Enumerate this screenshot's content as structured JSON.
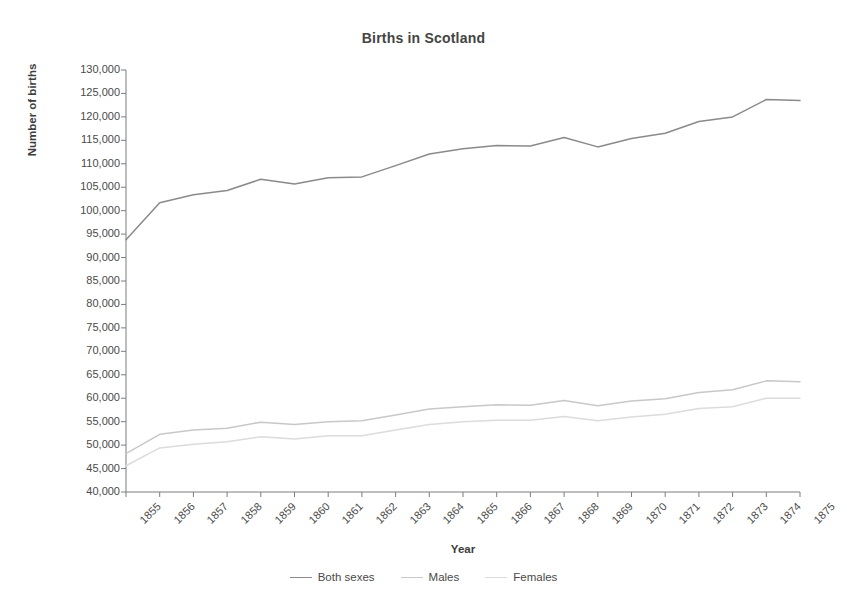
{
  "chart_data": {
    "type": "line",
    "title": "Births in Scotland",
    "xlabel": "Year",
    "ylabel": "Number of births",
    "grid": false,
    "legend_position": "bottom",
    "x": [
      1855,
      1856,
      1857,
      1858,
      1859,
      1860,
      1861,
      1862,
      1863,
      1864,
      1865,
      1866,
      1867,
      1868,
      1869,
      1870,
      1871,
      1872,
      1873,
      1874,
      1875
    ],
    "categories": [
      "1855",
      "1856",
      "1857",
      "1858",
      "1859",
      "1860",
      "1861",
      "1862",
      "1863",
      "1864",
      "1865",
      "1866",
      "1867",
      "1868",
      "1869",
      "1870",
      "1871",
      "1872",
      "1873",
      "1874",
      "1875"
    ],
    "xlim": [
      1855,
      1875
    ],
    "ylim": [
      40000,
      130000
    ],
    "ytick_labels": [
      "130,000",
      "125,000",
      "120,000",
      "115,000",
      "110,000",
      "105,000",
      "100,000",
      "95,000",
      "90,000",
      "85,000",
      "80,000",
      "75,000",
      "70,000",
      "65,000",
      "60,000",
      "55,000",
      "50,000",
      "45,000",
      "40,000"
    ],
    "ytick_values": [
      130000,
      125000,
      120000,
      115000,
      110000,
      105000,
      100000,
      95000,
      90000,
      85000,
      80000,
      75000,
      70000,
      65000,
      60000,
      55000,
      50000,
      45000,
      40000
    ],
    "ytick_step": 5000,
    "series": [
      {
        "name": "Both sexes",
        "color": "#8a8a8a",
        "values": [
          93800,
          101700,
          103400,
          104300,
          106700,
          105700,
          107000,
          107200,
          109600,
          112100,
          113200,
          113900,
          113800,
          115600,
          113600,
          115400,
          116500,
          119000,
          120000,
          123700,
          123500
        ]
      },
      {
        "name": "Males",
        "color": "#c8c8c8",
        "values": [
          48200,
          52300,
          53200,
          53600,
          54900,
          54400,
          55000,
          55200,
          56400,
          57700,
          58200,
          58600,
          58500,
          59500,
          58400,
          59400,
          59900,
          61200,
          61800,
          63700,
          63500
        ]
      },
      {
        "name": "Females",
        "color": "#dcdcdc",
        "values": [
          45600,
          49400,
          50200,
          50700,
          51800,
          51300,
          52000,
          52000,
          53200,
          54400,
          55000,
          55300,
          55300,
          56100,
          55200,
          56000,
          56600,
          57800,
          58200,
          60000,
          60000
        ]
      }
    ]
  },
  "legend": {
    "entries": [
      {
        "label": "Both sexes"
      },
      {
        "label": "Males"
      },
      {
        "label": "Females"
      }
    ]
  },
  "axes": {
    "axis_color": "#7d7d7d",
    "background": "#ffffff"
  }
}
